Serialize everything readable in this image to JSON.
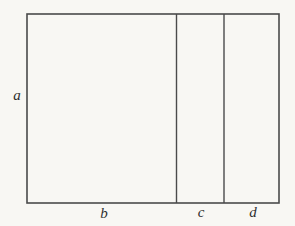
{
  "figure": {
    "labels": {
      "side_height": "a",
      "bottom_section_1": "b",
      "bottom_section_2": "c",
      "bottom_section_3": "d"
    },
    "colors": {
      "line": "#4a4a4a",
      "background": "#f8f7f3",
      "label_text": "#2f2f2f"
    }
  }
}
